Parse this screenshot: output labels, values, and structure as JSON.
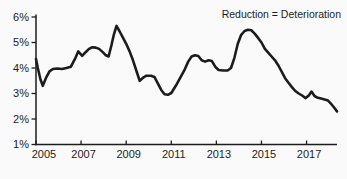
{
  "chart": {
    "annotation_label": "Reduction = Deterioration",
    "colors": {
      "line": "#1c1c1c",
      "axis": "#1c1c1c",
      "text": "#1c1c1c",
      "background": "#fafafa"
    }
  },
  "chart_data": {
    "type": "line",
    "title": "",
    "xlabel": "",
    "ylabel": "",
    "annotation": "Reduction = Deterioration",
    "annotation_position": "top-right",
    "grid": false,
    "legend": false,
    "xlim": [
      2005,
      2018.35
    ],
    "ylim": [
      1,
      6
    ],
    "x_ticks": [
      2005,
      2007,
      2009,
      2011,
      2013,
      2015,
      2017
    ],
    "x_tick_labels": [
      "2005",
      "2007",
      "2009",
      "2011",
      "2013",
      "2015",
      "2017"
    ],
    "y_ticks": [
      1,
      2,
      3,
      4,
      5,
      6
    ],
    "y_tick_labels": [
      "1%",
      "2%",
      "3%",
      "4%",
      "5%",
      "6%"
    ],
    "series": [
      {
        "name": "rate-percent",
        "x": [
          2005.0,
          2005.08,
          2005.2,
          2005.3,
          2005.45,
          2005.6,
          2005.75,
          2005.95,
          2006.15,
          2006.35,
          2006.55,
          2006.75,
          2006.87,
          2007.05,
          2007.2,
          2007.35,
          2007.5,
          2007.65,
          2007.8,
          2007.95,
          2008.1,
          2008.22,
          2008.35,
          2008.45,
          2008.57,
          2008.7,
          2008.85,
          2009.0,
          2009.15,
          2009.3,
          2009.45,
          2009.6,
          2009.75,
          2009.9,
          2010.1,
          2010.25,
          2010.4,
          2010.55,
          2010.7,
          2010.85,
          2011.0,
          2011.2,
          2011.4,
          2011.6,
          2011.75,
          2011.9,
          2012.05,
          2012.2,
          2012.35,
          2012.5,
          2012.65,
          2012.8,
          2012.95,
          2013.1,
          2013.3,
          2013.5,
          2013.65,
          2013.8,
          2013.95,
          2014.1,
          2014.25,
          2014.4,
          2014.55,
          2014.7,
          2014.85,
          2015.0,
          2015.15,
          2015.3,
          2015.45,
          2015.6,
          2015.75,
          2015.9,
          2016.05,
          2016.2,
          2016.35,
          2016.5,
          2016.65,
          2016.8,
          2016.95,
          2017.1,
          2017.22,
          2017.35,
          2017.5,
          2017.65,
          2017.8,
          2017.95,
          2018.1,
          2018.22,
          2018.35
        ],
        "y": [
          4.35,
          4.0,
          3.55,
          3.3,
          3.62,
          3.87,
          3.96,
          3.98,
          3.96,
          4.0,
          4.05,
          4.4,
          4.65,
          4.48,
          4.62,
          4.75,
          4.81,
          4.8,
          4.75,
          4.63,
          4.5,
          4.45,
          4.9,
          5.3,
          5.65,
          5.45,
          5.2,
          4.95,
          4.65,
          4.3,
          3.9,
          3.5,
          3.62,
          3.7,
          3.7,
          3.65,
          3.4,
          3.15,
          2.97,
          2.95,
          3.02,
          3.3,
          3.62,
          3.95,
          4.25,
          4.45,
          4.5,
          4.47,
          4.3,
          4.25,
          4.3,
          4.27,
          4.05,
          3.92,
          3.9,
          3.9,
          4.0,
          4.4,
          4.95,
          5.3,
          5.45,
          5.5,
          5.48,
          5.35,
          5.18,
          5.0,
          4.75,
          4.6,
          4.45,
          4.3,
          4.1,
          3.85,
          3.6,
          3.42,
          3.25,
          3.1,
          3.0,
          2.92,
          2.82,
          2.92,
          3.08,
          2.9,
          2.83,
          2.8,
          2.77,
          2.72,
          2.58,
          2.45,
          2.3
        ]
      }
    ]
  }
}
